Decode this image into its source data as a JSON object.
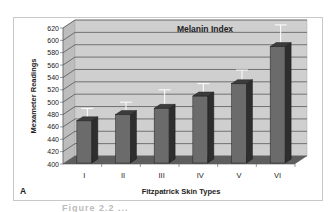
{
  "chart_data": {
    "type": "bar",
    "style": "3d-column",
    "title": "Melanin Index",
    "xlabel": "Fitzpatrick Skin Types",
    "ylabel": "Mexameter Readings",
    "panel_label": "A",
    "categories": [
      "I",
      "II",
      "III",
      "IV",
      "V",
      "VI"
    ],
    "values": [
      470,
      480,
      490,
      510,
      530,
      590
    ],
    "error_upper": [
      490,
      500,
      520,
      530,
      552,
      625
    ],
    "ylim": [
      400,
      620
    ],
    "yticks": [
      "620",
      "600",
      "580",
      "560",
      "540",
      "520",
      "500",
      "480",
      "460",
      "440",
      "420",
      "400"
    ],
    "grid": true,
    "legend": "none"
  },
  "colors": {
    "bar_front": "#6b6b6b",
    "bar_side": "#2e2e2e",
    "bar_top": "#3c3c3c",
    "wall": "#cfcfcf",
    "floor": "#5e5e5e",
    "gridline": "#333333",
    "error_bar": "#ffffff"
  },
  "caption": "Figure 2.2 ..."
}
